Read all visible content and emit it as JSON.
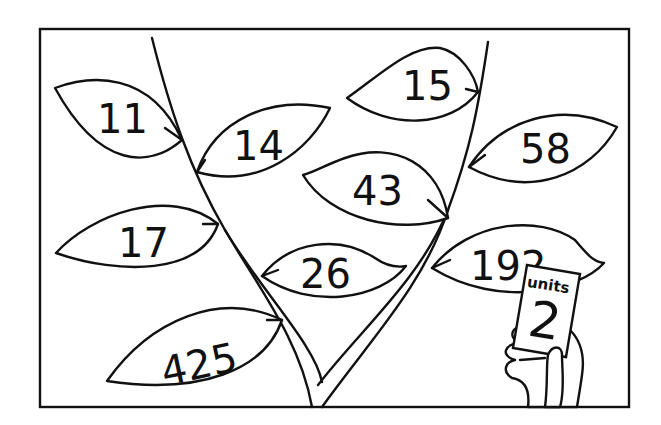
{
  "illustration": {
    "title": "Number leaves on a stem",
    "leaves": [
      {
        "id": "leaf-11",
        "value": "11",
        "side": "left-stem"
      },
      {
        "id": "leaf-14",
        "value": "14",
        "side": "left-stem"
      },
      {
        "id": "leaf-17",
        "value": "17",
        "side": "left-stem"
      },
      {
        "id": "leaf-26",
        "value": "26",
        "side": "left-stem"
      },
      {
        "id": "leaf-425",
        "value": "425",
        "side": "left-stem"
      },
      {
        "id": "leaf-15",
        "value": "15",
        "side": "right-stem"
      },
      {
        "id": "leaf-58",
        "value": "58",
        "side": "right-stem"
      },
      {
        "id": "leaf-43",
        "value": "43",
        "side": "right-stem"
      },
      {
        "id": "leaf-192",
        "value": "192",
        "side": "right-stem"
      }
    ],
    "card": {
      "label": "units",
      "value": "2"
    },
    "colors": {
      "line": "#111111",
      "background": "#ffffff"
    }
  }
}
